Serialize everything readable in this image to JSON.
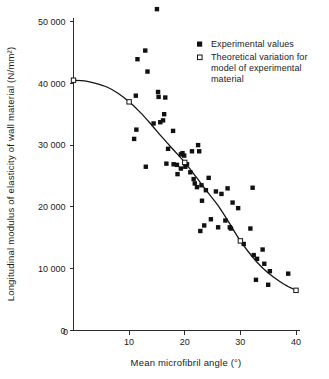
{
  "chart_data": {
    "type": "scatter",
    "title": "",
    "xlabel": "Mean microfibril angle (°)",
    "ylabel": "Longitudinal modulus of elasticity of wall material (N/mm²)",
    "xlim": [
      0,
      40
    ],
    "ylim": [
      0,
      52500
    ],
    "grid": false,
    "legend_position": "top-right",
    "xticks": [
      0,
      10,
      20,
      30,
      40
    ],
    "xtick_labels": [
      "0",
      "10",
      "20",
      "30",
      "40"
    ],
    "yticks": [
      0,
      10000,
      20000,
      30000,
      40000,
      50000
    ],
    "ytick_labels": [
      "0",
      "10 000",
      "20 000",
      "30 000",
      "40 000",
      "50 000"
    ],
    "series": [
      {
        "name": "Experimental values",
        "marker": "filled-square",
        "color": "#111111",
        "points": [
          [
            15.0,
            52000
          ],
          [
            12.9,
            45300
          ],
          [
            11.5,
            43900
          ],
          [
            13.3,
            41900
          ],
          [
            15.2,
            38600
          ],
          [
            15.3,
            37800
          ],
          [
            16.5,
            37700
          ],
          [
            11.2,
            38000
          ],
          [
            16.3,
            35000
          ],
          [
            15.6,
            33700
          ],
          [
            14.4,
            33500
          ],
          [
            16.1,
            34000
          ],
          [
            11.3,
            32500
          ],
          [
            10.9,
            31000
          ],
          [
            17.9,
            32300
          ],
          [
            13.0,
            26500
          ],
          [
            17.0,
            29400
          ],
          [
            16.7,
            27000
          ],
          [
            18.0,
            26900
          ],
          [
            18.6,
            26800
          ],
          [
            19.3,
            28500
          ],
          [
            19.6,
            28700
          ],
          [
            19.9,
            28300
          ],
          [
            20.1,
            26500
          ],
          [
            19.3,
            26200
          ],
          [
            18.7,
            25300
          ],
          [
            20.4,
            26900
          ],
          [
            21.0,
            25600
          ],
          [
            21.3,
            29000
          ],
          [
            22.4,
            30000
          ],
          [
            22.6,
            29000
          ],
          [
            21.6,
            24500
          ],
          [
            21.8,
            23800
          ],
          [
            22.2,
            23200
          ],
          [
            23.0,
            23500
          ],
          [
            24.3,
            24700
          ],
          [
            23.1,
            21000
          ],
          [
            22.8,
            16100
          ],
          [
            23.8,
            22700
          ],
          [
            24.7,
            18000
          ],
          [
            25.6,
            22500
          ],
          [
            23.5,
            17000
          ],
          [
            26.0,
            16700
          ],
          [
            26.6,
            22100
          ],
          [
            27.7,
            23000
          ],
          [
            27.3,
            17800
          ],
          [
            28.1,
            16700
          ],
          [
            28.6,
            20700
          ],
          [
            29.6,
            19800
          ],
          [
            28.3,
            16500
          ],
          [
            30.6,
            14000
          ],
          [
            31.8,
            16500
          ],
          [
            32.2,
            23100
          ],
          [
            32.4,
            12200
          ],
          [
            33.0,
            11600
          ],
          [
            32.8,
            8200
          ],
          [
            34.0,
            13100
          ],
          [
            34.3,
            10800
          ],
          [
            35.0,
            7400
          ],
          [
            35.3,
            9600
          ],
          [
            38.6,
            9200
          ]
        ]
      },
      {
        "name": "Theoretical variation for model of experimental material",
        "marker": "open-square",
        "color": "#ffffff",
        "points": [
          [
            0.0,
            40500
          ],
          [
            10.0,
            37000
          ],
          [
            20.0,
            27200
          ],
          [
            30.0,
            14500
          ],
          [
            40.0,
            6500
          ]
        ],
        "curve": [
          [
            0.0,
            40500
          ],
          [
            2.0,
            40400
          ],
          [
            4.0,
            40000
          ],
          [
            6.0,
            39400
          ],
          [
            8.0,
            38400
          ],
          [
            10.0,
            37000
          ],
          [
            12.0,
            35300
          ],
          [
            14.0,
            33300
          ],
          [
            16.0,
            31200
          ],
          [
            18.0,
            29200
          ],
          [
            20.0,
            27200
          ],
          [
            22.0,
            24900
          ],
          [
            24.0,
            22500
          ],
          [
            26.0,
            20200
          ],
          [
            28.0,
            17400
          ],
          [
            30.0,
            14500
          ],
          [
            32.0,
            12100
          ],
          [
            34.0,
            10100
          ],
          [
            36.0,
            8600
          ],
          [
            38.0,
            7400
          ],
          [
            40.0,
            6500
          ]
        ]
      }
    ],
    "legend": [
      {
        "label": "Experimental values",
        "marker": "filled-square"
      },
      {
        "label": "Theoretical variation for",
        "marker": "open-square"
      },
      {
        "label": "model of experimental",
        "marker": "none"
      },
      {
        "label": "material",
        "marker": "none"
      }
    ]
  },
  "colors": {
    "axis": "#2b2b2b",
    "curve": "#141414",
    "experimental_marker": "#111111",
    "theoretical_marker_fill": "#ffffff",
    "background": "#ffffff"
  }
}
